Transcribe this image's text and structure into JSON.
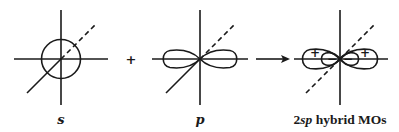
{
  "diagram": {
    "panels": [
      {
        "id": "s",
        "label": "s",
        "shape": "circle"
      },
      {
        "id": "p",
        "label": "p",
        "shape": "dumbbell"
      },
      {
        "id": "hybrid",
        "label_prefix": "2",
        "label_italic": "sp",
        "label_suffix": " hybrid MOs",
        "shape": "two sp lobes"
      }
    ],
    "operators": {
      "plus": "+",
      "arrow": "→"
    },
    "lobe_signs": {
      "outer_left": "+",
      "inner_left": "−",
      "inner_right": "−",
      "outer_right": "+"
    },
    "colors": {
      "ink": "#1a1a1a",
      "background": "#ffffff"
    }
  }
}
